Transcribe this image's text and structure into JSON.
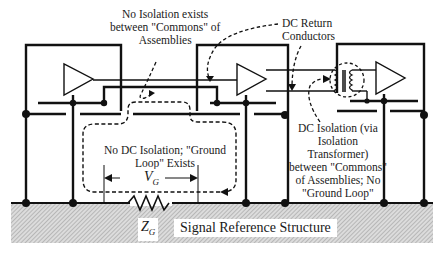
{
  "diagram": {
    "labels": {
      "no_isolation": [
        "No Isolation exists",
        "between \"Commons\" of",
        "Assemblies"
      ],
      "dc_return": [
        "DC Return",
        "Conductors"
      ],
      "no_dc_isolation": [
        "No DC Isolation; \"Ground",
        "Loop\" Exists"
      ],
      "dc_isolation": [
        "DC Isolation (via",
        "Isolation",
        "Transformer)",
        "between \"Commons\"",
        "of Assemblies; No",
        "\"Ground Loop\""
      ],
      "vg_symbol": "V",
      "vg_subscript": "G",
      "zg_symbol": "Z",
      "zg_subscript": "G",
      "signal_reference_structure": "Signal Reference Structure"
    },
    "components": {
      "assemblies": [
        "left-assembly",
        "middle-assembly",
        "right-assembly"
      ],
      "amplifiers": [
        "amplifier-1",
        "amplifier-2",
        "amplifier-3"
      ],
      "transformer": "isolation-transformer",
      "impedance": "ground-impedance-resistor"
    },
    "colors": {
      "line": "#111111",
      "hatch_bg": "#d9d9d9",
      "hatch_line": "#a8a8a8"
    }
  }
}
